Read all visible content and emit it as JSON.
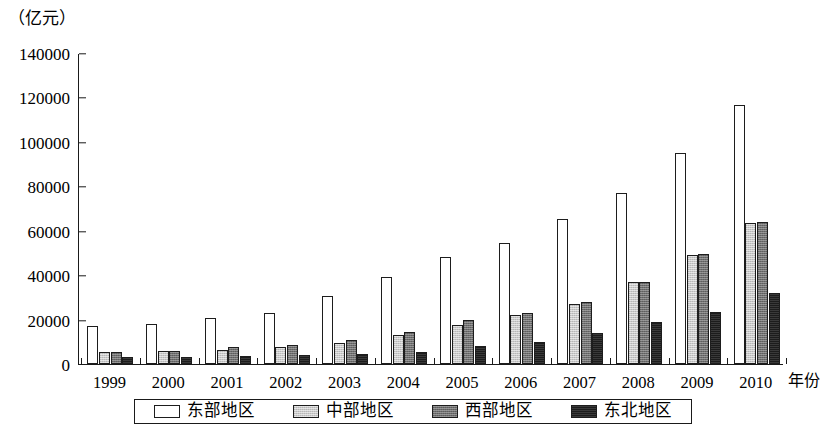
{
  "chart_data": {
    "type": "bar",
    "title": "",
    "subtitle": "",
    "unit_label": "（亿元）",
    "ylabel": "",
    "xlabel": "年份",
    "grid": false,
    "legend_position": "bottom",
    "ylim": [
      0,
      140000
    ],
    "ytick_step": 20000,
    "yticks": [
      "0",
      "20000",
      "40000",
      "60000",
      "80000",
      "100000",
      "120000",
      "140000"
    ],
    "ytick_values": [
      0,
      20000,
      40000,
      60000,
      80000,
      100000,
      120000,
      140000
    ],
    "categories": [
      "1999",
      "2000",
      "2001",
      "2002",
      "2003",
      "2004",
      "2005",
      "2006",
      "2007",
      "2008",
      "2009",
      "2010"
    ],
    "series": [
      {
        "name": "东部地区",
        "color": "#ffffff",
        "values": [
          17000,
          18000,
          20500,
          23000,
          30500,
          39000,
          48000,
          54500,
          65500,
          77000,
          95000,
          116500
        ]
      },
      {
        "name": "中部地区",
        "color": "#c9c9c9",
        "values": [
          5500,
          6000,
          6500,
          7500,
          9500,
          13000,
          17500,
          22000,
          27000,
          37000,
          49000,
          63500
        ]
      },
      {
        "name": "西部地区",
        "color": "#6e6e6e",
        "values": [
          5500,
          6000,
          7500,
          8500,
          11000,
          14500,
          20000,
          23000,
          28000,
          37000,
          49500,
          64000
        ]
      },
      {
        "name": "东北地区",
        "color": "#1c1c1c",
        "values": [
          3000,
          3000,
          3500,
          4000,
          4500,
          5500,
          8000,
          10000,
          14000,
          19000,
          23500,
          32000
        ]
      }
    ]
  }
}
